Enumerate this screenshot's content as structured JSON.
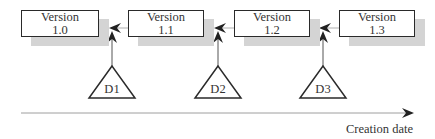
{
  "diagram": {
    "type": "version-history",
    "versions": [
      {
        "line1": "Version",
        "line2": "1.0"
      },
      {
        "line1": "Version",
        "line2": "1.1"
      },
      {
        "line1": "Version",
        "line2": "1.2"
      },
      {
        "line1": "Version",
        "line2": "1.3"
      }
    ],
    "deltas": [
      {
        "label": "D1"
      },
      {
        "label": "D2"
      },
      {
        "label": "D3"
      }
    ],
    "axis_label": "Creation date",
    "colors": {
      "stroke": "#2a2a2a",
      "shadow": "#d4d4d4",
      "connector": "#bdbdbd",
      "axis": "#9e9e9e"
    }
  }
}
